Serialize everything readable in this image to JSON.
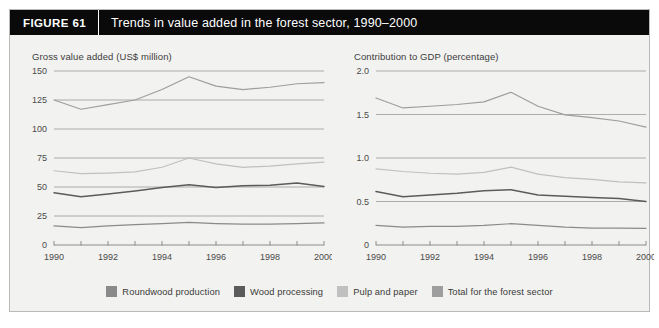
{
  "header": {
    "figure_label": "FIGURE  61",
    "title": "Trends in value added in the forest sector, 1990–2000"
  },
  "colors": {
    "roundwood_production": "#8a8a8a",
    "wood_processing": "#5b5b5b",
    "pulp_and_paper": "#c0c0c0",
    "total_forest_sector": "#9e9e9e",
    "header_background": "#0a0a0a",
    "panel_background": "#f2f2f0",
    "grid": "#9a9a9a",
    "axis": "#8d8d8d",
    "text": "#3c3c3c"
  },
  "legend": {
    "position": "bottom-center",
    "items": [
      {
        "label": "Roundwood production",
        "color": "#8a8a8a"
      },
      {
        "label": "Wood processing",
        "color": "#5b5b5b"
      },
      {
        "label": "Pulp and paper",
        "color": "#c0c0c0"
      },
      {
        "label": "Total for the forest sector",
        "color": "#9e9e9e"
      }
    ]
  },
  "chart_data": [
    {
      "id": "gross-value-added",
      "type": "line",
      "title": "Gross value added (US$ million)",
      "subtitle": "Gross value added (US$ million)",
      "xlabel": "",
      "ylabel": "Gross value added (US$ million)",
      "grid": true,
      "legend": "shared-bottom",
      "x": [
        1990,
        1991,
        1992,
        1993,
        1994,
        1995,
        1996,
        1997,
        1998,
        1999,
        2000
      ],
      "xtick_labels": [
        "1990",
        "",
        "1992",
        "",
        "1994",
        "",
        "1996",
        "",
        "1998",
        "",
        "2000"
      ],
      "xlim": [
        1990,
        2000
      ],
      "ylim": [
        0,
        150
      ],
      "ytick_values": [
        0,
        25,
        50,
        75,
        100,
        125,
        150
      ],
      "ytick_labels": [
        "0",
        "25",
        "50",
        "75",
        "100",
        "125",
        "150"
      ],
      "series": [
        {
          "name": "Roundwood production",
          "color": "#8a8a8a",
          "values": [
            16.5,
            15.0,
            16.5,
            17.5,
            18.5,
            19.5,
            18.5,
            18.0,
            18.0,
            18.5,
            19.0
          ]
        },
        {
          "name": "Wood processing",
          "color": "#5b5b5b",
          "values": [
            45.0,
            41.5,
            44.0,
            46.5,
            49.5,
            52.0,
            49.5,
            51.0,
            51.5,
            53.5,
            50.5
          ]
        },
        {
          "name": "Pulp and paper",
          "color": "#c0c0c0",
          "values": [
            64.0,
            61.5,
            62.0,
            63.0,
            67.0,
            75.0,
            70.0,
            67.0,
            68.0,
            70.0,
            71.5
          ]
        },
        {
          "name": "Total for the forest sector",
          "color": "#9e9e9e",
          "values": [
            125.0,
            117.0,
            121.0,
            125.0,
            134.0,
            145.0,
            137.0,
            134.0,
            136.0,
            139.0,
            140.0
          ]
        }
      ]
    },
    {
      "id": "contribution-to-gdp",
      "type": "line",
      "title": "Contribution to GDP (percentage)",
      "subtitle": "Contribution to GDP (percentage)",
      "xlabel": "",
      "ylabel": "Contribution to GDP (percentage)",
      "grid": true,
      "legend": "shared-bottom",
      "x": [
        1990,
        1991,
        1992,
        1993,
        1994,
        1995,
        1996,
        1997,
        1998,
        1999,
        2000
      ],
      "xtick_labels": [
        "1990",
        "",
        "1992",
        "",
        "1994",
        "",
        "1996",
        "",
        "1998",
        "",
        "2000"
      ],
      "xlim": [
        0,
        2.0
      ],
      "ylim": [
        0,
        2.0
      ],
      "ytick_values": [
        0,
        0.5,
        1.0,
        1.5,
        2.0
      ],
      "ytick_labels": [
        "0",
        "0.5",
        "1.0",
        "1.5",
        "2.0"
      ],
      "series": [
        {
          "name": "Roundwood production",
          "color": "#8a8a8a",
          "values": [
            0.225,
            0.205,
            0.215,
            0.215,
            0.225,
            0.245,
            0.225,
            0.205,
            0.195,
            0.195,
            0.19
          ]
        },
        {
          "name": "Wood processing",
          "color": "#5b5b5b",
          "values": [
            0.615,
            0.555,
            0.575,
            0.595,
            0.625,
            0.635,
            0.575,
            0.56,
            0.545,
            0.535,
            0.5
          ]
        },
        {
          "name": "Pulp and paper",
          "color": "#c0c0c0",
          "values": [
            0.875,
            0.845,
            0.825,
            0.815,
            0.835,
            0.895,
            0.815,
            0.775,
            0.755,
            0.725,
            0.715
          ]
        },
        {
          "name": "Total for the forest sector",
          "color": "#9e9e9e",
          "values": [
            1.69,
            1.575,
            1.595,
            1.615,
            1.645,
            1.755,
            1.595,
            1.495,
            1.465,
            1.425,
            1.355
          ]
        }
      ]
    }
  ]
}
